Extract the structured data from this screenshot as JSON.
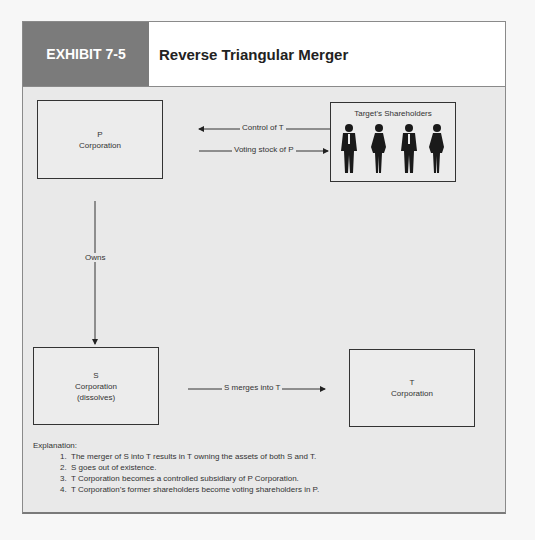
{
  "exhibit": {
    "label": "EXHIBIT 7-5",
    "title": "Reverse Triangular Merger"
  },
  "diagram": {
    "p_box": {
      "line1": "P",
      "line2": "Corporation"
    },
    "shareholders_box": {
      "title": "Target's Shareholders",
      "figure_count": 4
    },
    "s_box": {
      "line1": "S",
      "line2": "Corporation",
      "line3": "(dissolves)"
    },
    "t_box": {
      "line1": "T",
      "line2": "Corporation"
    },
    "arrows": {
      "control": "Control of T",
      "voting": "Voting stock of P",
      "owns": "Owns",
      "merge": "S merges into T"
    }
  },
  "explanation": {
    "heading": "Explanation:",
    "items": [
      "The merger of S into T results in T owning the assets of both S and T.",
      "S goes out of existence.",
      "T Corporation becomes a controlled subsidiary of P Corporation.",
      "T Corporation’s former shareholders become voting shareholders in P."
    ]
  },
  "colors": {
    "label_bg": "#7b7b7b",
    "panel_bg": "#e9e9e9",
    "header_bg": "#ffffff"
  }
}
